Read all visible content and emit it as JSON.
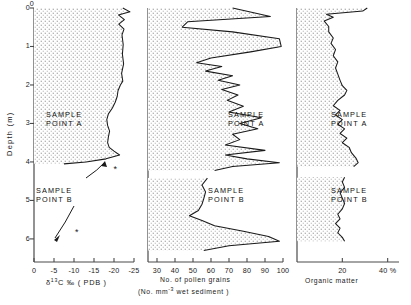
{
  "figure": {
    "y_axis": {
      "label": "Depth (m)",
      "ticks": [
        0,
        1,
        2,
        3,
        4,
        5,
        6
      ],
      "range": [
        0,
        6.6
      ]
    },
    "panels": [
      {
        "id": "d13c",
        "x_label_main": "C ‰ ( PDB )",
        "x_label_delta": "δ",
        "x_label_sup": "13",
        "x_label_sub": "",
        "x_ticks": [
          0,
          -5,
          -10,
          -15,
          -20,
          -25
        ],
        "x_tick_labels": [
          "0",
          "-5",
          "-10",
          "-15",
          "-20",
          "-25"
        ],
        "x_range": [
          0,
          -25
        ],
        "annotations": [
          {
            "name": "sample-point-a",
            "lines": [
              "SAMPLE",
              "POINT A"
            ]
          },
          {
            "name": "sample-point-b",
            "lines": [
              "SAMPLE",
              "POINT B"
            ]
          }
        ],
        "markers": [
          {
            "name": "sample-b-marker-upper",
            "x": -20.6,
            "depth": 4.22
          },
          {
            "name": "sample-b-marker-lower",
            "x": -11.0,
            "depth": 5.84
          }
        ],
        "curve": [
          {
            "depth": 0.0,
            "value": -22.2
          },
          {
            "depth": 0.1,
            "value": -24.0
          },
          {
            "depth": 0.18,
            "value": -21.1
          },
          {
            "depth": 0.3,
            "value": -22.6
          },
          {
            "depth": 0.42,
            "value": -21.2
          },
          {
            "depth": 0.55,
            "value": -22.5
          },
          {
            "depth": 0.7,
            "value": -22.0
          },
          {
            "depth": 0.95,
            "value": -22.3
          },
          {
            "depth": 1.2,
            "value": -22.1
          },
          {
            "depth": 1.45,
            "value": -22.4
          },
          {
            "depth": 1.7,
            "value": -21.9
          },
          {
            "depth": 1.9,
            "value": -22.2
          },
          {
            "depth": 2.0,
            "value": -21.6
          },
          {
            "depth": 2.15,
            "value": -21.0
          },
          {
            "depth": 2.3,
            "value": -20.8
          },
          {
            "depth": 2.45,
            "value": -20.3
          },
          {
            "depth": 2.6,
            "value": -19.6
          },
          {
            "depth": 2.75,
            "value": -18.6
          },
          {
            "depth": 2.9,
            "value": -18.2
          },
          {
            "depth": 3.05,
            "value": -18.4
          },
          {
            "depth": 3.2,
            "value": -18.9
          },
          {
            "depth": 3.35,
            "value": -18.6
          },
          {
            "depth": 3.5,
            "value": -18.4
          },
          {
            "depth": 3.62,
            "value": -18.8
          },
          {
            "depth": 3.72,
            "value": -20.0
          },
          {
            "depth": 3.82,
            "value": -21.4
          },
          {
            "depth": 3.92,
            "value": -18.0
          },
          {
            "depth": 4.0,
            "value": -13.0
          },
          {
            "depth": 4.05,
            "value": -7.5
          }
        ]
      },
      {
        "id": "pollen",
        "x_label_main": "No. of pollen grains",
        "x_label_sub_line": "(No. mm  wet sediment )",
        "x_label_sub_sup": "-3",
        "x_ticks": [
          30,
          40,
          50,
          60,
          70,
          80,
          90,
          100
        ],
        "x_tick_labels": [
          "30",
          "40",
          "50",
          "60",
          "70",
          "80",
          "90",
          "100"
        ],
        "x_range": [
          25,
          100
        ],
        "annotations": [
          {
            "name": "sample-point-a",
            "lines": [
              "SAMPLE",
              "POINT A"
            ]
          },
          {
            "name": "sample-point-b",
            "lines": [
              "SAMPLE",
              "POINT B"
            ]
          }
        ],
        "curve_a": [
          {
            "depth": 0.0,
            "value": 72
          },
          {
            "depth": 0.22,
            "value": 93
          },
          {
            "depth": 0.36,
            "value": 47
          },
          {
            "depth": 0.5,
            "value": 44
          },
          {
            "depth": 0.62,
            "value": 72
          },
          {
            "depth": 0.8,
            "value": 98
          },
          {
            "depth": 1.0,
            "value": 99
          },
          {
            "depth": 1.14,
            "value": 82
          },
          {
            "depth": 1.3,
            "value": 60
          },
          {
            "depth": 1.42,
            "value": 52
          },
          {
            "depth": 1.52,
            "value": 66
          },
          {
            "depth": 1.64,
            "value": 57
          },
          {
            "depth": 1.76,
            "value": 72
          },
          {
            "depth": 1.88,
            "value": 64
          },
          {
            "depth": 2.0,
            "value": 76
          },
          {
            "depth": 2.12,
            "value": 66
          },
          {
            "depth": 2.26,
            "value": 75
          },
          {
            "depth": 2.4,
            "value": 69
          },
          {
            "depth": 2.55,
            "value": 78
          },
          {
            "depth": 2.7,
            "value": 70
          },
          {
            "depth": 2.85,
            "value": 88
          },
          {
            "depth": 3.0,
            "value": 76
          },
          {
            "depth": 3.14,
            "value": 86
          },
          {
            "depth": 3.28,
            "value": 72
          },
          {
            "depth": 3.42,
            "value": 76
          },
          {
            "depth": 3.56,
            "value": 68
          },
          {
            "depth": 3.7,
            "value": 90
          },
          {
            "depth": 3.82,
            "value": 68
          },
          {
            "depth": 3.92,
            "value": 80
          },
          {
            "depth": 4.02,
            "value": 98
          },
          {
            "depth": 4.12,
            "value": 72
          },
          {
            "depth": 4.22,
            "value": 62
          }
        ],
        "curve_b": [
          {
            "depth": 4.42,
            "value": 58
          },
          {
            "depth": 4.6,
            "value": 55
          },
          {
            "depth": 4.78,
            "value": 57
          },
          {
            "depth": 4.95,
            "value": 56
          },
          {
            "depth": 5.1,
            "value": 55
          },
          {
            "depth": 5.26,
            "value": 53
          },
          {
            "depth": 5.4,
            "value": 48
          },
          {
            "depth": 5.52,
            "value": 55
          },
          {
            "depth": 5.66,
            "value": 62
          },
          {
            "depth": 5.8,
            "value": 78
          },
          {
            "depth": 5.94,
            "value": 92
          },
          {
            "depth": 6.06,
            "value": 98
          },
          {
            "depth": 6.18,
            "value": 70
          },
          {
            "depth": 6.3,
            "value": 56
          }
        ]
      },
      {
        "id": "organic",
        "x_label_main": "Organic matter",
        "x_ticks": [
          20,
          40
        ],
        "x_tick_labels": [
          "20",
          "40 %"
        ],
        "x_range": [
          0,
          45
        ],
        "annotations": [
          {
            "name": "sample-point-a",
            "lines": [
              "SAMPLE",
              "POINT A"
            ]
          },
          {
            "name": "sample-point-b",
            "lines": [
              "SAMPLE",
              "POINT B"
            ]
          }
        ],
        "curve_a": [
          {
            "depth": 0.0,
            "value": 31
          },
          {
            "depth": 0.08,
            "value": 29
          },
          {
            "depth": 0.16,
            "value": 13
          },
          {
            "depth": 0.24,
            "value": 16
          },
          {
            "depth": 0.34,
            "value": 12
          },
          {
            "depth": 0.48,
            "value": 14
          },
          {
            "depth": 0.62,
            "value": 14
          },
          {
            "depth": 0.78,
            "value": 16
          },
          {
            "depth": 0.92,
            "value": 15
          },
          {
            "depth": 1.08,
            "value": 17
          },
          {
            "depth": 1.24,
            "value": 16
          },
          {
            "depth": 1.4,
            "value": 18
          },
          {
            "depth": 1.56,
            "value": 17
          },
          {
            "depth": 1.72,
            "value": 18
          },
          {
            "depth": 1.88,
            "value": 19
          },
          {
            "depth": 2.02,
            "value": 20
          },
          {
            "depth": 2.14,
            "value": 22
          },
          {
            "depth": 2.26,
            "value": 21
          },
          {
            "depth": 2.4,
            "value": 18
          },
          {
            "depth": 2.54,
            "value": 16
          },
          {
            "depth": 2.66,
            "value": 19
          },
          {
            "depth": 2.78,
            "value": 17
          },
          {
            "depth": 2.9,
            "value": 20
          },
          {
            "depth": 3.02,
            "value": 18
          },
          {
            "depth": 3.14,
            "value": 21
          },
          {
            "depth": 3.26,
            "value": 19
          },
          {
            "depth": 3.38,
            "value": 22
          },
          {
            "depth": 3.5,
            "value": 20
          },
          {
            "depth": 3.62,
            "value": 23
          },
          {
            "depth": 3.76,
            "value": 24
          },
          {
            "depth": 3.9,
            "value": 26
          },
          {
            "depth": 4.02,
            "value": 27
          },
          {
            "depth": 4.12,
            "value": 25
          }
        ],
        "curve_b": [
          {
            "depth": 4.4,
            "value": 21
          },
          {
            "depth": 4.52,
            "value": 20
          },
          {
            "depth": 4.66,
            "value": 21
          },
          {
            "depth": 4.8,
            "value": 19
          },
          {
            "depth": 4.94,
            "value": 20
          },
          {
            "depth": 5.08,
            "value": 21
          },
          {
            "depth": 5.22,
            "value": 20
          },
          {
            "depth": 5.36,
            "value": 18
          },
          {
            "depth": 5.48,
            "value": 19
          },
          {
            "depth": 5.6,
            "value": 17
          },
          {
            "depth": 5.72,
            "value": 19
          },
          {
            "depth": 5.84,
            "value": 18
          },
          {
            "depth": 5.96,
            "value": 20
          },
          {
            "depth": 6.06,
            "value": 21
          }
        ]
      }
    ],
    "colors": {
      "line": "#1a1a1a",
      "axis": "#4a4a4a",
      "stipple": "#8c8c8c",
      "background": "#ffffff"
    }
  }
}
